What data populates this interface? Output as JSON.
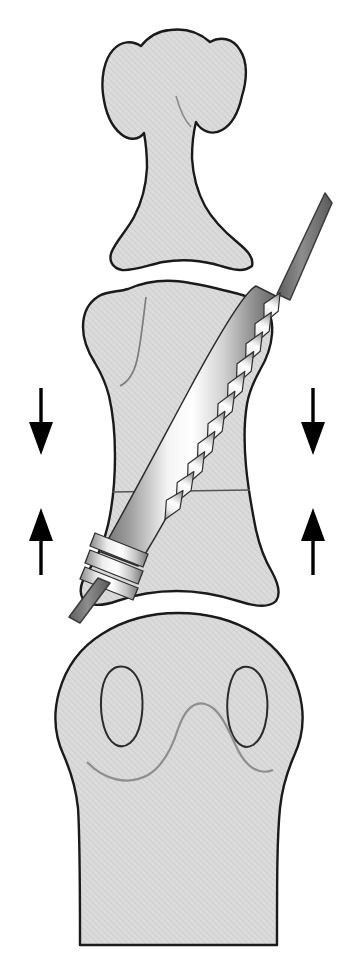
{
  "figure": {
    "kind": "medical-illustration",
    "view": "dorsal-palmar (AP) view of finger phalanges",
    "width": 338,
    "height": 977,
    "background_color": "#ffffff"
  },
  "palette": {
    "bone_fill": "#d8d8d8",
    "bone_fill_light": "#dedede",
    "bone_outline": "#1a1a1a",
    "inner_contour": "#7a7a7a",
    "fracture_line": "#555555",
    "arrow_color": "#000000",
    "screw_highlight": "#ffffff",
    "screw_midtone": "#c9c9c9",
    "screw_shadow": "#6e6e6e",
    "screw_outline": "#2b2b2b",
    "driver_shaft": "#7b7b7b",
    "driver_shaft_dark": "#5d5d5d"
  },
  "anatomy": {
    "parts": [
      {
        "id": "distal-phalanx",
        "label": "Distal phalanx",
        "position": "top",
        "features": [
          "ungual tuberosity / apical tuft",
          "narrow diaphysis",
          "flared base"
        ]
      },
      {
        "id": "middle-phalanx",
        "label": "Middle phalanx",
        "position": "middle",
        "features": [
          "concave base",
          "waisted shaft",
          "condylar head"
        ]
      },
      {
        "id": "proximal-phalanx-head",
        "label": "Proximal phalanx head and shaft",
        "position": "bottom",
        "features": [
          "two condyles shown as oval outlines",
          "intercondylar notch"
        ]
      }
    ],
    "joint_spaces": [
      {
        "id": "dip-joint",
        "label": "Distal interphalangeal joint space",
        "note": "wavy white gap between distal and middle phalanx, crossed by the screw"
      },
      {
        "id": "pip-joint",
        "label": "Proximal interphalangeal joint space",
        "note": "white gap between middle phalanx head and proximal phalanx head"
      }
    ],
    "osteotomy_line": {
      "label": "Transverse fracture / osteotomy line across middle phalanx",
      "y": 492
    }
  },
  "implant": {
    "id": "headless-compression-screw",
    "label": "Headless tapered compression screw",
    "orientation": "oblique, entering from distal-lateral (upper right) to proximal-medial (lower left)",
    "entry_point": {
      "x": 320,
      "y": 198
    },
    "exit_point": {
      "x": 72,
      "y": 592
    },
    "components": [
      {
        "id": "driver-shaft-proximal",
        "label": "Driver / guide wire shaft at screw entry",
        "color": "#7b7b7b"
      },
      {
        "id": "leading-threads",
        "label": "Fine distal thread run",
        "thread_count": 13
      },
      {
        "id": "trailing-threads",
        "label": "Coarse trailing thread cluster near tip",
        "thread_count": 4
      },
      {
        "id": "driver-shaft-distal",
        "label": "Protruding shaft tip below bone",
        "color": "#6f6f6f"
      }
    ]
  },
  "annotations": {
    "arrows": [
      {
        "id": "arrow-top-left",
        "direction": "down",
        "x": 41,
        "y_start": 388,
        "y_end": 455,
        "meaning": "compression toward fusion site"
      },
      {
        "id": "arrow-top-right",
        "direction": "down",
        "x": 313,
        "y_start": 388,
        "y_end": 455,
        "meaning": "compression toward fusion site"
      },
      {
        "id": "arrow-bottom-left",
        "direction": "up",
        "x": 41,
        "y_start": 575,
        "y_end": 508,
        "meaning": "compression toward fusion site"
      },
      {
        "id": "arrow-bottom-right",
        "direction": "up",
        "x": 313,
        "y_start": 575,
        "y_end": 508,
        "meaning": "compression toward fusion site"
      }
    ],
    "arrow_count": 4,
    "arrow_semantics": "Opposing arrow pairs indicate axial interfragmentary compression generated by the screw"
  },
  "text_labels": []
}
